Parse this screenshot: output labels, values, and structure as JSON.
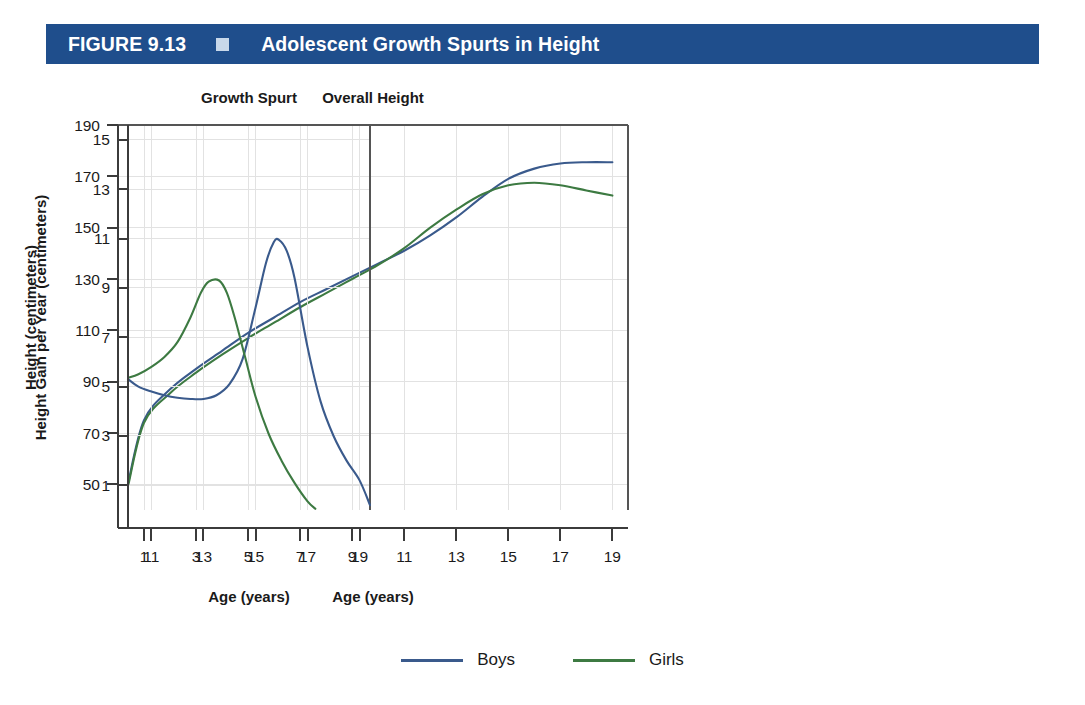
{
  "header": {
    "figure_label": "FIGURE 9.13",
    "title": "Adolescent Growth Spurts in Height",
    "bar_color": "#1f4e8c",
    "marker_color": "#c8d8ea",
    "text_color": "#ffffff"
  },
  "legend": {
    "items": [
      {
        "label": "Boys",
        "color": "#3a5a8c"
      },
      {
        "label": "Girls",
        "color": "#3d7a42"
      }
    ]
  },
  "colors": {
    "boys": "#3a5a8c",
    "girls": "#3d7a42",
    "grid": "#e2e2e2",
    "axis": "#3b3b3b"
  },
  "chart_data": [
    {
      "id": "overall-height",
      "type": "line",
      "title": "Overall Height",
      "xlabel": "Age (years)",
      "ylabel": "Height (centimeters)",
      "xlim": [
        0,
        19.6
      ],
      "ylim": [
        40,
        190
      ],
      "xticks": [
        1,
        3,
        5,
        7,
        9,
        11,
        13,
        15,
        17,
        19
      ],
      "yticks": [
        50,
        70,
        90,
        110,
        130,
        150,
        170,
        190
      ],
      "grid": true,
      "legend_position": "bottom-center",
      "series": [
        {
          "name": "Boys",
          "color": "#3a5a8c",
          "x": [
            0.4,
            1,
            2,
            3,
            4,
            5,
            6,
            7,
            8,
            9,
            10,
            11,
            12,
            13,
            14,
            15,
            16,
            17,
            18,
            19
          ],
          "values": [
            51,
            75,
            87,
            95,
            102,
            109,
            115,
            121,
            126,
            131,
            136,
            141,
            147,
            154,
            162,
            169,
            173,
            175,
            175.5,
            175.5
          ]
        },
        {
          "name": "Girls",
          "color": "#3d7a42",
          "x": [
            0.4,
            1,
            2,
            3,
            4,
            5,
            6,
            7,
            8,
            9,
            10,
            11,
            12,
            13,
            14,
            15,
            16,
            17,
            18,
            19
          ],
          "values": [
            50,
            74,
            85.5,
            93.5,
            100.5,
            107,
            113,
            119,
            124.5,
            130,
            135.5,
            142,
            150,
            157,
            163,
            166.5,
            167.5,
            166.5,
            164.5,
            162.5
          ]
        }
      ]
    },
    {
      "id": "growth-spurt",
      "type": "line",
      "title": "Growth Spurt",
      "xlabel": "Age (years)",
      "ylabel": "Height Gain per Year (centimeters)",
      "xlim": [
        10.1,
        19.4
      ],
      "ylim": [
        0,
        15.6
      ],
      "xticks": [
        11,
        13,
        15,
        17,
        19
      ],
      "yticks": [
        1,
        3,
        5,
        7,
        9,
        11,
        13,
        15
      ],
      "grid": true,
      "legend_position": "bottom-center",
      "series": [
        {
          "name": "Boys",
          "color": "#3a5a8c",
          "x": [
            10.1,
            10.5,
            11,
            11.5,
            12,
            12.5,
            13,
            13.5,
            14,
            14.5,
            15,
            15.4,
            15.7,
            15.9,
            16.2,
            16.5,
            17,
            17.5,
            18,
            18.5,
            19,
            19.4
          ],
          "values": [
            5.3,
            5.0,
            4.8,
            4.65,
            4.55,
            4.5,
            4.5,
            4.65,
            5.1,
            6.1,
            8.2,
            10.0,
            10.85,
            10.95,
            10.5,
            9.4,
            6.6,
            4.4,
            3.0,
            2.0,
            1.2,
            0.2
          ]
        },
        {
          "name": "Girls",
          "color": "#3d7a42",
          "x": [
            10.1,
            10.5,
            11,
            11.5,
            12,
            12.5,
            12.9,
            13.2,
            13.6,
            13.9,
            14.2,
            14.6,
            15,
            15.5,
            16,
            16.5,
            17,
            17.3
          ],
          "values": [
            5.35,
            5.5,
            5.8,
            6.2,
            6.8,
            7.8,
            8.8,
            9.25,
            9.3,
            8.8,
            7.8,
            6.2,
            4.6,
            3.1,
            2.0,
            1.1,
            0.35,
            0.05
          ]
        }
      ]
    }
  ]
}
